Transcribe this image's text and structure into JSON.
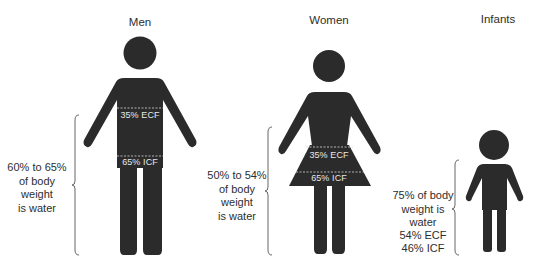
{
  "colors": {
    "figure": "#2b2b2b",
    "text": "#2e2e2e",
    "inner_text": "#e8e8e8",
    "brace": "#555555"
  },
  "groups": [
    {
      "title": "Men",
      "body_water": [
        "60% to 65%",
        "of body",
        "weight",
        "is water"
      ],
      "ecf": "35% ECF",
      "icf": "65% ICF"
    },
    {
      "title": "Women",
      "body_water": [
        "50% to 54%",
        "of body",
        "weight",
        "is water"
      ],
      "ecf": "35% ECF",
      "icf": "65% ICF"
    },
    {
      "title": "Infants",
      "body_water": [
        "75% of body",
        "weight is",
        "water"
      ],
      "ecf": "54% ECF",
      "icf": "46% ICF"
    }
  ]
}
